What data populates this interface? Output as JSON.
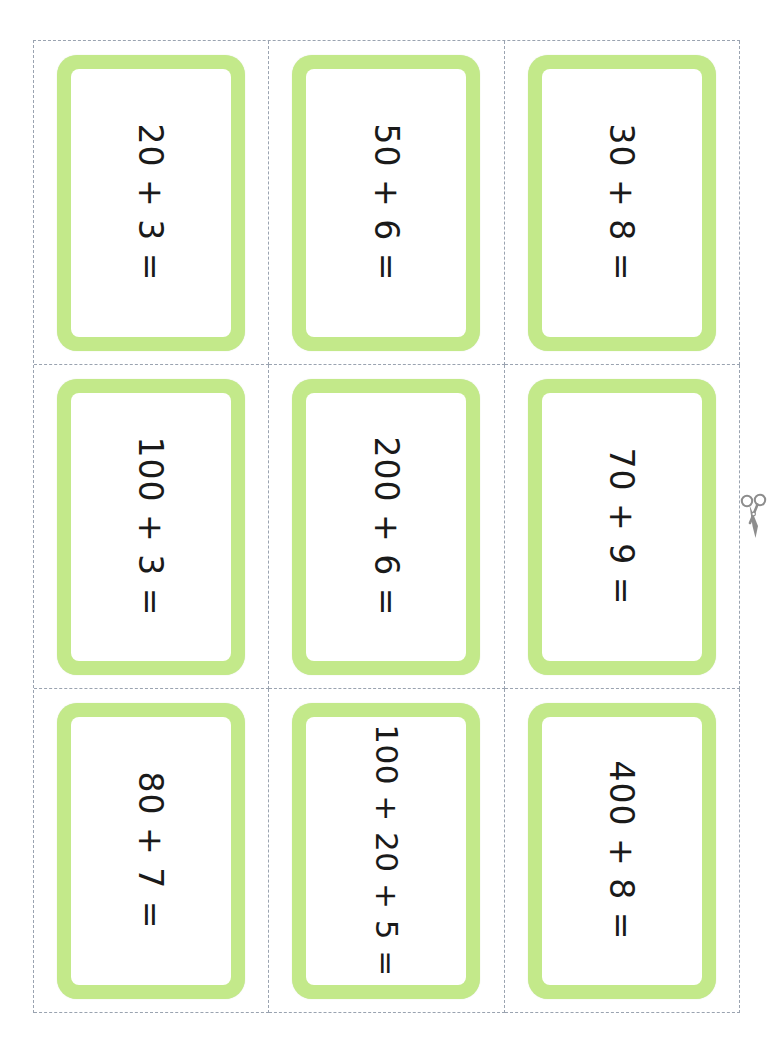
{
  "sheet": {
    "title": "Place Value Addition Flashcards",
    "accent_color": "#c3e98a",
    "cut_line_color": "#9aa3b0",
    "text_color": "#1a1a1a",
    "scissors_color": "#8d8d8d",
    "columns": 3,
    "rows": 3
  },
  "icons": {
    "scissors": "scissors-icon"
  },
  "cards": [
    {
      "expression": "20 + 3 ="
    },
    {
      "expression": "50 + 6 ="
    },
    {
      "expression": "30 + 8 ="
    },
    {
      "expression": "100 + 3 ="
    },
    {
      "expression": "200 + 6 ="
    },
    {
      "expression": "70 + 9 ="
    },
    {
      "expression": "80 + 7 ="
    },
    {
      "expression": "100 + 20 + 5 ="
    },
    {
      "expression": "400 + 8 ="
    }
  ]
}
